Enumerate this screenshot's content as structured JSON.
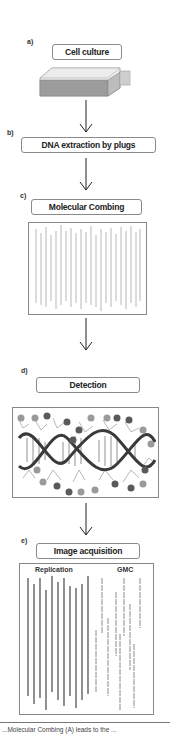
{
  "figure": {
    "steps": [
      {
        "letter": "a)",
        "label": "Cell culture",
        "icon": "cell-culture-flask-icon"
      },
      {
        "letter": "b)",
        "label": "DNA extraction by plugs"
      },
      {
        "letter": "c)",
        "label": "Molecular Combing",
        "panel": "combed-dna-fibers"
      },
      {
        "letter": "d)",
        "label": "Detection",
        "panel": "dna-helix-with-probes"
      },
      {
        "letter": "e)",
        "label": "Image acquisition",
        "panel": "fiber-images",
        "panel_labels": {
          "left": "Replication",
          "right": "GMC"
        }
      }
    ],
    "arrow_icon": "down-arrow-icon",
    "colors": {
      "outline": "#888888",
      "fiber_light": "#b8b8b8",
      "fiber_dark": "#555555",
      "helix_dark": "#3a3a3a",
      "probe_gray": "#9a9a9a",
      "probe_dark": "#5a5a5a"
    },
    "caption_fragment": "...Molecular Combing (A) leads to the ..."
  }
}
